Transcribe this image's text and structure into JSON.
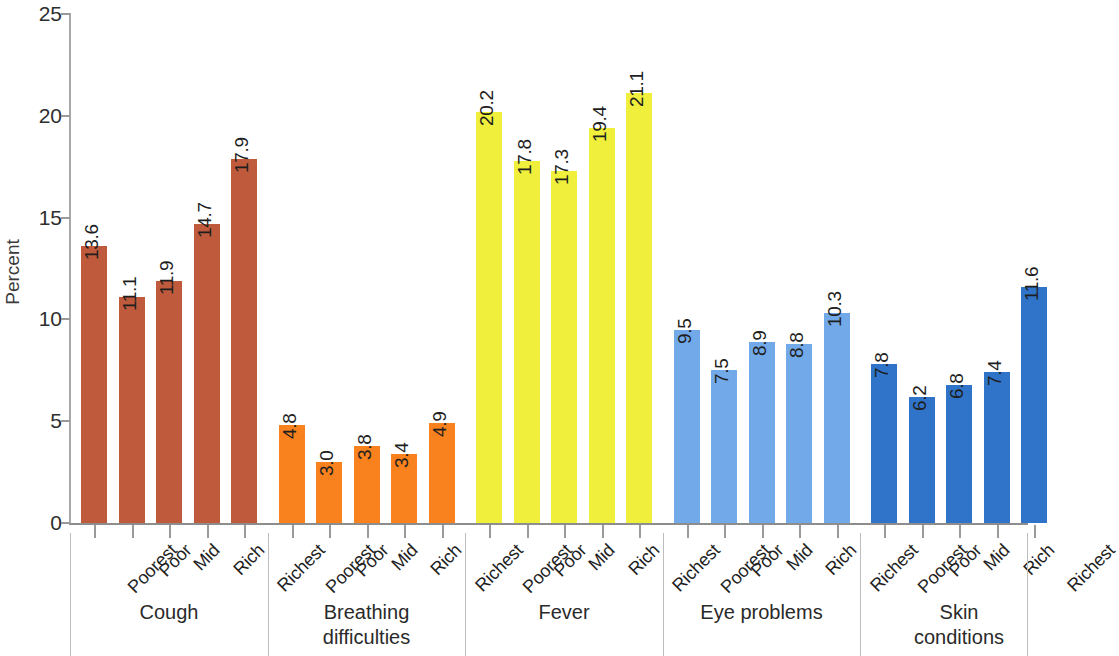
{
  "chart_data": {
    "type": "bar",
    "title": "",
    "xlabel": "",
    "ylabel": "Percent",
    "ylim": [
      0,
      25
    ],
    "ytick_labels": [
      "0",
      "5",
      "10",
      "15",
      "20",
      "25"
    ],
    "ytick_values": [
      0,
      5,
      10,
      15,
      20,
      25
    ],
    "grid": false,
    "legend": "none",
    "categories": [
      "Poorest",
      "Poor",
      "Mid",
      "Rich",
      "Richest"
    ],
    "groups": [
      {
        "label": "Cough",
        "label_lines": [
          "Cough"
        ],
        "color": "#c05a3c",
        "categories": [
          "Poorest",
          "Poor",
          "Mid",
          "Rich",
          "Richest"
        ],
        "values": [
          13.6,
          11.1,
          11.9,
          14.7,
          17.9
        ],
        "value_labels": [
          "13.6",
          "11.1",
          "11.9",
          "14.7",
          "17.9"
        ]
      },
      {
        "label": "Breathing difficulties",
        "label_lines": [
          "Breathing",
          "difficulties"
        ],
        "color": "#f9821e",
        "categories": [
          "Poorest",
          "Poor",
          "Mid",
          "Rich",
          "Richest"
        ],
        "values": [
          4.8,
          3.0,
          3.8,
          3.4,
          4.9
        ],
        "value_labels": [
          "4.8",
          "3.0",
          "3.8",
          "3.4",
          "4.9"
        ]
      },
      {
        "label": "Fever",
        "label_lines": [
          "Fever"
        ],
        "color": "#efef3c",
        "categories": [
          "Poorest",
          "Poor",
          "Mid",
          "Rich",
          "Richest"
        ],
        "values": [
          20.2,
          17.8,
          17.3,
          19.4,
          21.1
        ],
        "value_labels": [
          "20.2",
          "17.8",
          "17.3",
          "19.4",
          "21.1"
        ]
      },
      {
        "label": "Eye problems",
        "label_lines": [
          "Eye problems"
        ],
        "color": "#72a9e8",
        "categories": [
          "Poorest",
          "Poor",
          "Mid",
          "Rich",
          "Richest"
        ],
        "values": [
          9.5,
          7.5,
          8.9,
          8.8,
          10.3
        ],
        "value_labels": [
          "9.5",
          "7.5",
          "8.9",
          "8.8",
          "10.3"
        ]
      },
      {
        "label": "Skin conditions",
        "label_lines": [
          "Skin",
          "conditions"
        ],
        "color": "#2f74c8",
        "categories": [
          "Poorest",
          "Poor",
          "Mid",
          "Rich",
          "Richest"
        ],
        "values": [
          7.8,
          6.2,
          6.8,
          7.4,
          11.6
        ],
        "value_labels": [
          "7.8",
          "6.2",
          "6.8",
          "7.4",
          "11.6"
        ]
      }
    ]
  }
}
